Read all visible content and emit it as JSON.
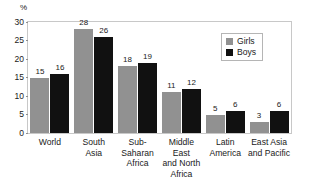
{
  "chart_data": {
    "type": "bar",
    "title": "",
    "xlabel": "",
    "ylabel": "%",
    "ylim": [
      0,
      30
    ],
    "yticks": [
      0,
      5,
      10,
      15,
      20,
      25,
      30
    ],
    "grid": false,
    "legend_position": "upper-right-inside",
    "categories": [
      "World",
      "South\nAsia",
      "Sub-\nSaharan\nAfrica",
      "Middle East\nand North\nAfrica",
      "Latin\nAmerica",
      "East Asia\nand Pacific"
    ],
    "series": [
      {
        "name": "Girls",
        "color": "#919191",
        "values": [
          15,
          28,
          18,
          11,
          5,
          3
        ]
      },
      {
        "name": "Boys",
        "color": "#111111",
        "values": [
          16,
          26,
          19,
          12,
          6,
          6
        ]
      }
    ]
  },
  "axis": {
    "percent_symbol": "%",
    "tick_labels": [
      "30",
      "25",
      "20",
      "15",
      "10",
      "5",
      "0"
    ]
  },
  "legend": {
    "entries": [
      {
        "label": "Girls",
        "color": "#919191"
      },
      {
        "label": "Boys",
        "color": "#111111"
      }
    ]
  }
}
